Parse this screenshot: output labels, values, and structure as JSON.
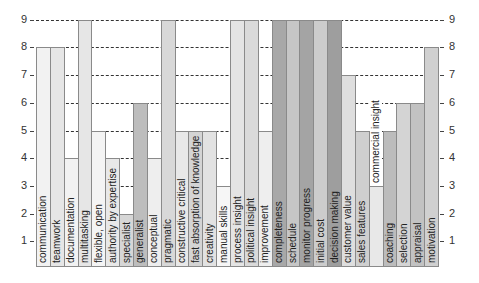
{
  "chart_data": {
    "type": "bar",
    "title": "",
    "xlabel": "",
    "ylabel": "",
    "ylim": [
      0,
      9
    ],
    "yticks": [
      1,
      2,
      3,
      4,
      5,
      6,
      7,
      8,
      9
    ],
    "grid": "horizontal dashed",
    "legend": "none",
    "categories": [
      "communication",
      "teamwork",
      "documentation",
      "multitasking",
      "flexible, open",
      "authority by expertise",
      "specialist",
      "generalist",
      "conceptual",
      "pragmatic",
      "constructive critical",
      "fast absorption of knowledge",
      "creativity",
      "manual skills",
      "process insight",
      "political insight",
      "improvement",
      "completeness",
      "schedule",
      "monitor progress",
      "initial cost",
      "decision making",
      "customer value",
      "sales features",
      "commercial insight",
      "coaching",
      "selection",
      "appraisal",
      "motivation"
    ],
    "values": [
      8,
      8,
      4,
      9,
      5,
      4,
      2,
      6,
      4,
      9,
      5,
      5,
      5,
      3,
      9,
      9,
      5,
      9,
      9,
      9,
      9,
      9,
      7,
      5,
      3,
      5,
      6,
      6,
      8
    ],
    "colors": [
      "#f2f2f2",
      "#e6e6e6",
      "#f2f2f2",
      "#e6e6e6",
      "#f4f4f4",
      "#e8e8e8",
      "#d6d6d6",
      "#bdbdbd",
      "#eeeeee",
      "#d8d8d8",
      "#e8e8e8",
      "#d4d4d4",
      "#e2e2e2",
      "#f6f6f6",
      "#e4e4e4",
      "#dadada",
      "#eeeeee",
      "#a8a8a8",
      "#c6c6c6",
      "#a4a4a4",
      "#cccccc",
      "#9e9e9e",
      "#dedede",
      "#cfcfcf",
      "#e8e8e8",
      "#bcbcbc",
      "#d4d4d4",
      "#c2c2c2",
      "#d0d0d0"
    ],
    "label_above_bar": [
      false,
      false,
      false,
      false,
      false,
      false,
      false,
      false,
      false,
      false,
      false,
      false,
      false,
      false,
      false,
      false,
      false,
      false,
      false,
      false,
      false,
      false,
      false,
      false,
      true,
      false,
      false,
      false,
      false
    ]
  }
}
